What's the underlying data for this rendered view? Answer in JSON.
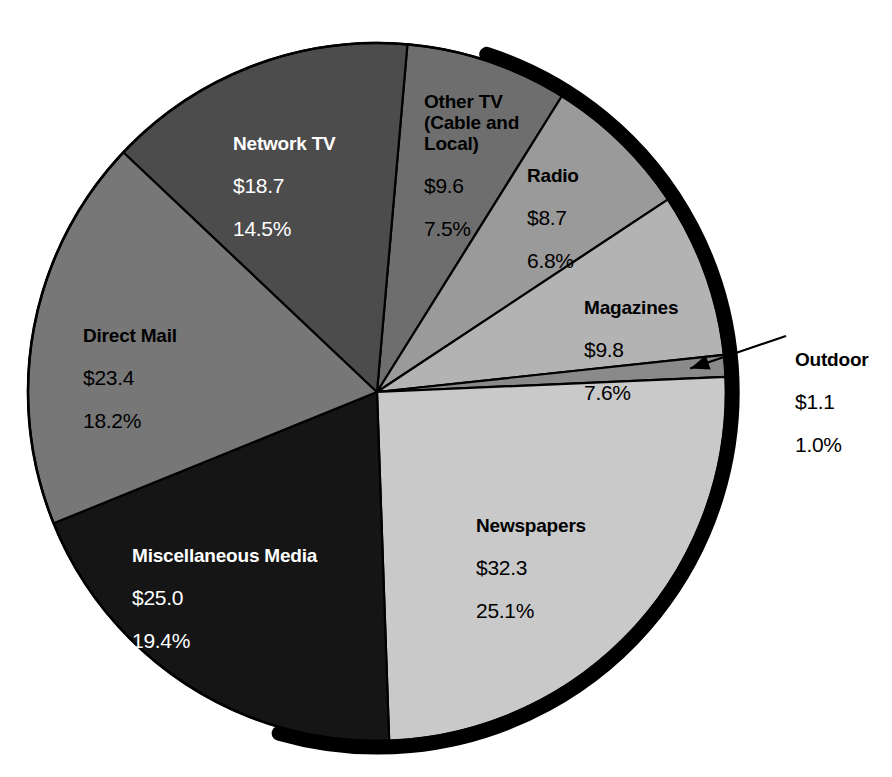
{
  "chart_data": {
    "type": "pie",
    "title": "",
    "subtitle": "",
    "xlabel": "",
    "ylabel": "",
    "units": "billions of dollars",
    "legend_position": "none",
    "grid": false,
    "value_prefix": "$",
    "percent_suffix": "%",
    "total_value": 128.6,
    "categories": [
      "Other TV (Cable and Local)",
      "Radio",
      "Magazines",
      "Outdoor",
      "Newspapers",
      "Miscellaneous Media",
      "Direct Mail",
      "Network TV"
    ],
    "values": [
      9.6,
      8.7,
      9.8,
      1.1,
      32.3,
      25.0,
      23.4,
      18.7
    ],
    "percents": [
      7.5,
      6.8,
      7.6,
      1.0,
      25.1,
      19.4,
      18.2,
      14.5
    ],
    "slices": [
      {
        "key": "other-tv",
        "label": "Other TV\n(Cable and\nLocal)",
        "label_plain": "Other TV (Cable and Local)",
        "value": "$9.6",
        "percent": "7.5%",
        "value_number": 9.6,
        "percent_number": 7.5,
        "color": "#6e6e6e",
        "text_color": "#000000",
        "start_angle": 5.0,
        "end_angle": 32.0
      },
      {
        "key": "radio",
        "label": "Radio",
        "label_plain": "Radio",
        "value": "$8.7",
        "percent": "6.8%",
        "value_number": 8.7,
        "percent_number": 6.8,
        "color": "#9a9a9a",
        "text_color": "#000000",
        "start_angle": 32.0,
        "end_angle": 56.5
      },
      {
        "key": "magazines",
        "label": "Magazines",
        "label_plain": "Magazines",
        "value": "$9.8",
        "percent": "7.6%",
        "value_number": 9.8,
        "percent_number": 7.6,
        "color": "#b3b3b3",
        "text_color": "#000000",
        "start_angle": 56.5,
        "end_angle": 83.9
      },
      {
        "key": "outdoor",
        "label": "Outdoor",
        "label_plain": "Outdoor",
        "value": "$1.1",
        "percent": "1.0%",
        "value_number": 1.1,
        "percent_number": 1.0,
        "color": "#8a8a8a",
        "text_color": "#000000",
        "start_angle": 83.9,
        "end_angle": 87.5,
        "callout": true
      },
      {
        "key": "newspapers",
        "label": "Newspapers",
        "label_plain": "Newspapers",
        "value": "$32.3",
        "percent": "25.1%",
        "value_number": 32.3,
        "percent_number": 25.1,
        "color": "#c9c9c9",
        "text_color": "#000000",
        "start_angle": 87.5,
        "end_angle": 178.0
      },
      {
        "key": "miscellaneous-media",
        "label": "Miscellaneous Media",
        "label_plain": "Miscellaneous Media",
        "value": "$25.0",
        "percent": "19.4%",
        "value_number": 25.0,
        "percent_number": 19.4,
        "color": "#151515",
        "text_color": "#ffffff",
        "start_angle": 178.0,
        "end_angle": 247.9
      },
      {
        "key": "direct-mail",
        "label": "Direct Mail",
        "label_plain": "Direct Mail",
        "value": "$23.4",
        "percent": "18.2%",
        "value_number": 23.4,
        "percent_number": 18.2,
        "color": "#777777",
        "text_color": "#000000",
        "start_angle": 247.9,
        "end_angle": 313.4
      },
      {
        "key": "network-tv",
        "label": "Network TV",
        "label_plain": "Network TV",
        "value": "$18.7",
        "percent": "14.5%",
        "value_number": 18.7,
        "percent_number": 14.5,
        "color": "#4c4c4c",
        "text_color": "#ffffff",
        "start_angle": 313.4,
        "end_angle": 365.0
      }
    ]
  },
  "colors": {
    "background": "#ffffff",
    "outline": "#000000",
    "shadow": "#000000",
    "callout_line": "#000000"
  },
  "geometry": {
    "center_x": 377,
    "center_y": 392,
    "radius": 349
  }
}
